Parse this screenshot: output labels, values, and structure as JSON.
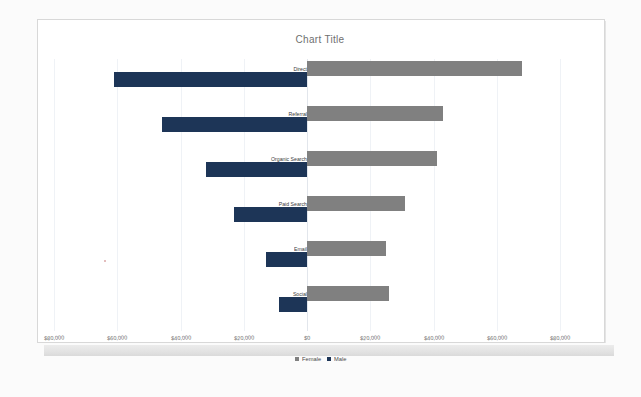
{
  "document": {
    "background_color": "#fbfbfb",
    "sheet_color": "#ffffff"
  },
  "chart_data": {
    "type": "bar",
    "variant": "tornado-butterfly-diverging",
    "title": "Chart Title",
    "xlabel": "",
    "ylabel": "",
    "orientation": "horizontal",
    "grid": true,
    "legend_position": "bottom",
    "axis_tick_labels": [
      "$80,000",
      "$60,000",
      "$40,000",
      "$20,000",
      "$0",
      "$20,000",
      "$40,000",
      "$60,000",
      "$80,000"
    ],
    "axis_tick_values": [
      -80000,
      -60000,
      -40000,
      -20000,
      0,
      20000,
      40000,
      60000,
      80000
    ],
    "xlim": [
      -80000,
      80000
    ],
    "categories": [
      "Direct",
      "Referral",
      "Organic Search",
      "Paid Search",
      "Email",
      "Social"
    ],
    "series": [
      {
        "name": "Female",
        "color": "#808080",
        "direction": "right",
        "values": [
          68000,
          43000,
          41000,
          31000,
          25000,
          26000
        ]
      },
      {
        "name": "Male",
        "color": "#1d3557",
        "direction": "left",
        "values": [
          61000,
          46000,
          32000,
          23000,
          13000,
          9000
        ]
      }
    ]
  },
  "legend": {
    "items": [
      {
        "label": "Female",
        "color": "#808080"
      },
      {
        "label": "Male",
        "color": "#1d3557"
      }
    ]
  }
}
